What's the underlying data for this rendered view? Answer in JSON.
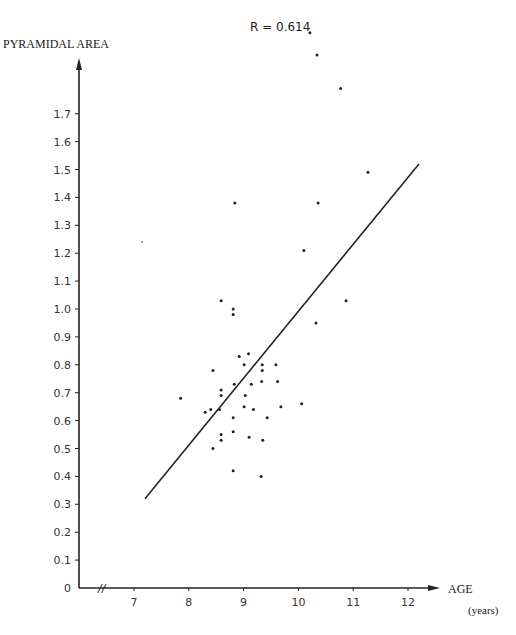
{
  "chart_data": {
    "type": "scatter",
    "title": "",
    "annotation": "R = 0.614",
    "xlabel": "AGE",
    "xlabel_units": "(years)",
    "ylabel": "PYRAMIDAL AREA",
    "xlim": [
      6.2,
      12.7
    ],
    "ylim": [
      0,
      1.85
    ],
    "x_axis_break": true,
    "x_ticks": [
      "7",
      "8",
      "9",
      "10",
      "11",
      "12"
    ],
    "y_ticks": [
      "0",
      "0.1",
      "0.2",
      "0.3",
      "0.4",
      "0.5",
      "0.6",
      "0.7",
      "0.8",
      "0.9",
      "1.0",
      "1.1",
      "1.2",
      "1.3",
      "1.4",
      "1.5",
      "1.6",
      "1.7"
    ],
    "grid": false,
    "legend": null,
    "regression_line": {
      "x": [
        7.2,
        12.2
      ],
      "y": [
        0.32,
        1.52
      ]
    },
    "points": [
      {
        "x": 10.21,
        "y": 1.99
      },
      {
        "x": 10.34,
        "y": 1.91
      },
      {
        "x": 10.77,
        "y": 1.79
      },
      {
        "x": 11.27,
        "y": 1.49
      },
      {
        "x": 10.36,
        "y": 1.38
      },
      {
        "x": 8.84,
        "y": 1.38
      },
      {
        "x": 7.15,
        "y": 1.24
      },
      {
        "x": 10.1,
        "y": 1.21
      },
      {
        "x": 8.59,
        "y": 1.03
      },
      {
        "x": 8.81,
        "y": 1.0
      },
      {
        "x": 8.81,
        "y": 0.98
      },
      {
        "x": 10.87,
        "y": 1.03
      },
      {
        "x": 10.32,
        "y": 0.95
      },
      {
        "x": 8.92,
        "y": 0.83
      },
      {
        "x": 9.09,
        "y": 0.84
      },
      {
        "x": 9.01,
        "y": 0.8
      },
      {
        "x": 9.34,
        "y": 0.8
      },
      {
        "x": 9.34,
        "y": 0.78
      },
      {
        "x": 9.59,
        "y": 0.8
      },
      {
        "x": 8.44,
        "y": 0.78
      },
      {
        "x": 8.83,
        "y": 0.73
      },
      {
        "x": 9.14,
        "y": 0.73
      },
      {
        "x": 9.33,
        "y": 0.74
      },
      {
        "x": 9.62,
        "y": 0.74
      },
      {
        "x": 8.59,
        "y": 0.71
      },
      {
        "x": 8.59,
        "y": 0.69
      },
      {
        "x": 9.03,
        "y": 0.69
      },
      {
        "x": 7.85,
        "y": 0.68
      },
      {
        "x": 8.3,
        "y": 0.63
      },
      {
        "x": 8.4,
        "y": 0.64
      },
      {
        "x": 8.56,
        "y": 0.64
      },
      {
        "x": 9.01,
        "y": 0.65
      },
      {
        "x": 9.18,
        "y": 0.64
      },
      {
        "x": 9.68,
        "y": 0.65
      },
      {
        "x": 10.06,
        "y": 0.66
      },
      {
        "x": 8.81,
        "y": 0.61
      },
      {
        "x": 9.43,
        "y": 0.61
      },
      {
        "x": 8.81,
        "y": 0.56
      },
      {
        "x": 8.59,
        "y": 0.55
      },
      {
        "x": 8.59,
        "y": 0.53
      },
      {
        "x": 9.1,
        "y": 0.54
      },
      {
        "x": 9.35,
        "y": 0.53
      },
      {
        "x": 8.44,
        "y": 0.5
      },
      {
        "x": 8.81,
        "y": 0.42
      },
      {
        "x": 9.32,
        "y": 0.4
      }
    ]
  },
  "labels": {
    "r_value": "R = 0.614",
    "y_axis_title": "PYRAMIDAL AREA",
    "x_axis_title": "AGE",
    "x_axis_units": "(years)",
    "axis_break": "//"
  },
  "colors": {
    "ink": "#222222",
    "background": "#ffffff"
  }
}
